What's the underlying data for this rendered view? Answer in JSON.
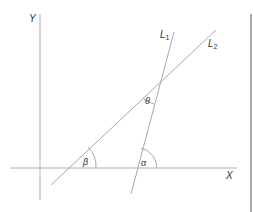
{
  "diagram": {
    "type": "geometry-lines-angles",
    "axes": {
      "x_label": "X",
      "y_label": "Y"
    },
    "lines": [
      {
        "label": "L",
        "subscript": "1"
      },
      {
        "label": "L",
        "subscript": "2"
      }
    ],
    "angles": {
      "theta": "θ",
      "beta": "β",
      "alpha": "α"
    },
    "colors": {
      "line": "#a8a8a8",
      "text": "#333333",
      "border": "#8c8c8c"
    }
  }
}
